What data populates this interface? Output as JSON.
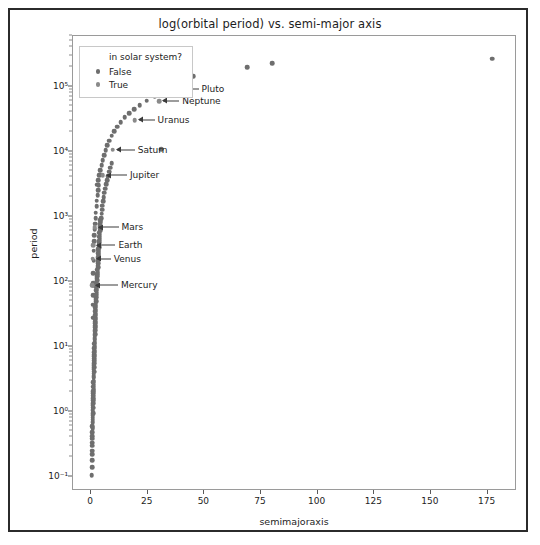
{
  "chart_data": {
    "type": "scatter",
    "title": "log(orbital period) vs. semi-major axis",
    "xlabel": "semimajoraxis",
    "ylabel": "period",
    "yscale": "log",
    "xscale": "linear",
    "xlim": [
      -8,
      188
    ],
    "ylim": [
      0.06,
      600000
    ],
    "grid": false,
    "legend": {
      "title": "in solar system?",
      "position": "upper left",
      "entries": [
        {
          "label": "False",
          "color": "#6e6e6e"
        },
        {
          "label": "True",
          "color": "#8a8a8a"
        }
      ]
    },
    "xticks": [
      0,
      25,
      50,
      75,
      100,
      125,
      150,
      175
    ],
    "xticklabels": [
      "0",
      "25",
      "50",
      "75",
      "100",
      "125",
      "150",
      "175"
    ],
    "yticks": [
      0.1,
      1,
      10,
      100,
      1000,
      10000,
      100000
    ],
    "yticklabels": [
      "10⁻¹",
      "10⁰",
      "10¹",
      "10²",
      "10³",
      "10⁴",
      "10⁵"
    ],
    "series": [
      {
        "name": "False",
        "color": "#6e6e6e",
        "points": [
          [
            0.3,
            0.105
          ],
          [
            0.45,
            0.18
          ],
          [
            0.5,
            0.25
          ],
          [
            0.55,
            0.33
          ],
          [
            0.6,
            0.42
          ],
          [
            0.65,
            0.55
          ],
          [
            0.7,
            0.68
          ],
          [
            0.75,
            0.8
          ],
          [
            0.8,
            0.95
          ],
          [
            0.85,
            1.15
          ],
          [
            0.9,
            1.35
          ],
          [
            0.95,
            1.6
          ],
          [
            1.0,
            1.9
          ],
          [
            1.05,
            2.2
          ],
          [
            1.1,
            2.6
          ],
          [
            1.15,
            3.0
          ],
          [
            1.2,
            3.5
          ],
          [
            1.25,
            4.1
          ],
          [
            1.3,
            4.8
          ],
          [
            1.35,
            5.6
          ],
          [
            1.4,
            6.5
          ],
          [
            1.45,
            7.5
          ],
          [
            1.5,
            8.7
          ],
          [
            1.55,
            10.2
          ],
          [
            1.6,
            11.8
          ],
          [
            1.65,
            13.5
          ],
          [
            1.7,
            15.5
          ],
          [
            1.75,
            18.0
          ],
          [
            1.8,
            21.0
          ],
          [
            1.85,
            24.0
          ],
          [
            1.9,
            28.0
          ],
          [
            1.95,
            32.0
          ],
          [
            2.0,
            37.0
          ],
          [
            2.1,
            43.0
          ],
          [
            2.2,
            50.0
          ],
          [
            2.3,
            58.0
          ],
          [
            2.4,
            67.0
          ],
          [
            2.5,
            78.0
          ],
          [
            2.6,
            90.0
          ],
          [
            2.7,
            105.0
          ],
          [
            2.8,
            122.0
          ],
          [
            2.9,
            140.0
          ],
          [
            3.0,
            165.0
          ],
          [
            3.1,
            190.0
          ],
          [
            3.2,
            220.0
          ],
          [
            3.3,
            255.0
          ],
          [
            3.4,
            295.0
          ],
          [
            3.5,
            340.0
          ],
          [
            3.6,
            395.0
          ],
          [
            3.7,
            455.0
          ],
          [
            3.8,
            530.0
          ],
          [
            3.9,
            610.0
          ],
          [
            4.0,
            710.0
          ],
          [
            4.2,
            820.0
          ],
          [
            4.4,
            950.0
          ],
          [
            4.6,
            1100.0
          ],
          [
            4.8,
            1280.0
          ],
          [
            5.0,
            1480.0
          ],
          [
            5.3,
            1720.0
          ],
          [
            5.6,
            2000.0
          ],
          [
            5.9,
            2320.0
          ],
          [
            6.2,
            2700.0
          ],
          [
            6.6,
            3130.0
          ],
          [
            7.0,
            3630.0
          ],
          [
            7.4,
            4200.0
          ],
          [
            7.9,
            4880.0
          ],
          [
            8.4,
            5660.0
          ],
          [
            9.0,
            6560.0
          ],
          [
            2.6,
            3100.0
          ],
          [
            3.1,
            3600.0
          ],
          [
            3.6,
            4300.0
          ],
          [
            4.1,
            5200.0
          ],
          [
            4.7,
            6200.0
          ],
          [
            5.2,
            7400.0
          ],
          [
            5.8,
            8800.0
          ],
          [
            6.5,
            10500.0
          ],
          [
            7.2,
            12500.0
          ],
          [
            8.0,
            14800.0
          ],
          [
            9.1,
            17500.0
          ],
          [
            10.2,
            20500.0
          ],
          [
            11.5,
            24000.0
          ],
          [
            13.0,
            28500.0
          ],
          [
            14.8,
            33500.0
          ],
          [
            16.8,
            39000.0
          ],
          [
            19.0,
            45000.0
          ],
          [
            21.5,
            52000.0
          ],
          [
            24.5,
            61000.0
          ],
          [
            28.0,
            71000.0
          ],
          [
            31.0,
            10800.0
          ],
          [
            35.0,
            98000.0
          ],
          [
            40.0,
            120000.0
          ],
          [
            45.0,
            145000.0
          ],
          [
            69.0,
            200000.0
          ],
          [
            80.0,
            230000.0
          ],
          [
            177.0,
            270000.0
          ],
          [
            1.1,
            210.0
          ],
          [
            1.3,
            420.0
          ],
          [
            1.6,
            640.0
          ],
          [
            2.0,
            950.0
          ],
          [
            2.4,
            1450.0
          ],
          [
            2.9,
            2150.0
          ],
          [
            3.4,
            3050.0
          ],
          [
            4.0,
            4400.0
          ],
          [
            0.9,
            95.0
          ],
          [
            1.0,
            135.0
          ],
          [
            1.2,
            300.0
          ],
          [
            1.4,
            520.0
          ],
          [
            1.7,
            780.0
          ],
          [
            2.1,
            1150.0
          ],
          [
            2.5,
            1750.0
          ],
          [
            3.0,
            2550.0
          ],
          [
            0.7,
            28.0
          ],
          [
            0.75,
            44.0
          ],
          [
            0.8,
            62.0
          ],
          [
            0.85,
            88.0
          ],
          [
            0.35,
            0.14
          ],
          [
            0.4,
            0.22
          ],
          [
            0.42,
            0.3
          ],
          [
            0.48,
            0.38
          ],
          [
            0.52,
            0.48
          ],
          [
            0.58,
            0.6
          ],
          [
            0.62,
            0.75
          ],
          [
            0.68,
            0.88
          ],
          [
            0.72,
            1.05
          ],
          [
            0.78,
            1.25
          ],
          [
            0.82,
            1.5
          ],
          [
            0.88,
            1.75
          ],
          [
            0.92,
            2.05
          ],
          [
            0.98,
            2.4
          ],
          [
            1.02,
            2.85
          ],
          [
            1.08,
            3.3
          ],
          [
            1.12,
            3.85
          ],
          [
            1.18,
            4.5
          ],
          [
            1.22,
            5.2
          ],
          [
            1.28,
            6.1
          ],
          [
            1.32,
            7.1
          ],
          [
            1.38,
            8.2
          ],
          [
            1.42,
            9.5
          ],
          [
            1.48,
            11.0
          ],
          [
            1.52,
            12.8
          ],
          [
            1.58,
            14.8
          ],
          [
            1.62,
            17.0
          ],
          [
            1.68,
            19.8
          ],
          [
            1.72,
            23.0
          ],
          [
            1.78,
            26.5
          ],
          [
            1.82,
            30.5
          ],
          [
            1.88,
            35.0
          ],
          [
            1.92,
            40.5
          ],
          [
            1.98,
            47.0
          ],
          [
            2.05,
            54.0
          ],
          [
            2.15,
            63.0
          ],
          [
            2.25,
            73.0
          ],
          [
            2.35,
            85.0
          ],
          [
            2.45,
            98.0
          ],
          [
            2.55,
            113.0
          ],
          [
            2.65,
            131.0
          ],
          [
            2.75,
            152.0
          ],
          [
            2.85,
            176.0
          ],
          [
            2.95,
            204.0
          ],
          [
            3.05,
            236.0
          ],
          [
            3.15,
            273.0
          ],
          [
            3.25,
            316.0
          ],
          [
            3.35,
            366.0
          ],
          [
            3.45,
            424.0
          ],
          [
            3.55,
            490.0
          ],
          [
            3.65,
            568.0
          ],
          [
            3.75,
            657.0
          ],
          [
            3.85,
            760.0
          ],
          [
            3.95,
            880.0
          ]
        ]
      },
      {
        "name": "True",
        "color": "#8a8a8a",
        "points": [
          [
            0.39,
            88.0
          ],
          [
            0.72,
            225.0
          ],
          [
            1.0,
            365.0
          ],
          [
            1.52,
            687.0
          ],
          [
            5.2,
            4333.0
          ],
          [
            9.58,
            10759.0
          ],
          [
            19.2,
            30688.0
          ],
          [
            30.05,
            60182.0
          ],
          [
            39.5,
            90560.0
          ]
        ]
      }
    ],
    "annotations": [
      {
        "label": "Mercury",
        "x": 0.39,
        "y": 88.0,
        "dx": 28,
        "dy": 0
      },
      {
        "label": "Venus",
        "x": 0.72,
        "y": 225.0,
        "dx": 20,
        "dy": 0
      },
      {
        "label": "Earth",
        "x": 1.0,
        "y": 365.0,
        "dx": 24,
        "dy": 0
      },
      {
        "label": "Mars",
        "x": 1.52,
        "y": 687.0,
        "dx": 26,
        "dy": 0
      },
      {
        "label": "Jupiter",
        "x": 5.2,
        "y": 4333.0,
        "dx": 26,
        "dy": 0
      },
      {
        "label": "Saturn",
        "x": 9.58,
        "y": 10759.0,
        "dx": 24,
        "dy": 0
      },
      {
        "label": "Uranus",
        "x": 19.2,
        "y": 30688.0,
        "dx": 22,
        "dy": 0
      },
      {
        "label": "Neptune",
        "x": 30.05,
        "y": 60182.0,
        "dx": 22,
        "dy": 0
      },
      {
        "label": "Pluto",
        "x": 39.5,
        "y": 90560.0,
        "dx": 20,
        "dy": 0
      }
    ]
  }
}
